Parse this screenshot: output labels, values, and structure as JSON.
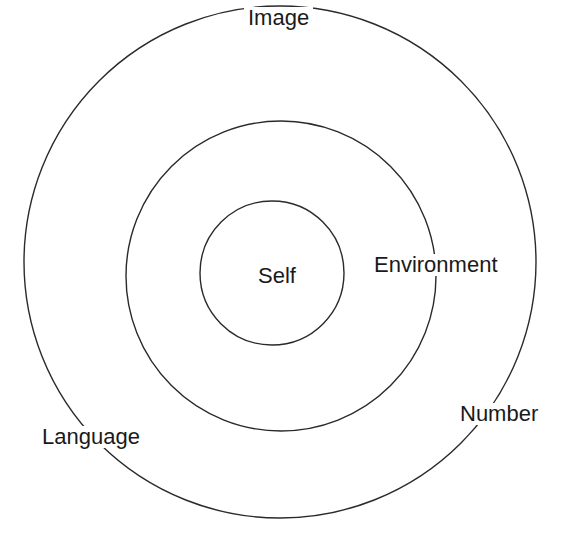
{
  "diagram": {
    "type": "concentric-circles",
    "stroke_color": "#2a2a2a",
    "background": "#ffffff",
    "circles": [
      {
        "name": "outer",
        "cx": 280,
        "cy": 262,
        "r": 256
      },
      {
        "name": "middle",
        "cx": 281,
        "cy": 276,
        "r": 155
      },
      {
        "name": "inner",
        "cx": 272,
        "cy": 273,
        "r": 72
      }
    ],
    "labels": {
      "inner": "Self",
      "middle": "Environment",
      "outer_top": "Image",
      "outer_right": "Number",
      "outer_left": "Language"
    }
  }
}
